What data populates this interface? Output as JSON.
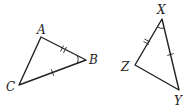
{
  "diagram": {
    "triangles": [
      {
        "name": "ABC",
        "vertices": {
          "A": {
            "label": "A",
            "x": 41,
            "y": 37,
            "lx": 37,
            "ly": 34
          },
          "B": {
            "label": "B",
            "x": 86,
            "y": 60,
            "lx": 89,
            "ly": 64
          },
          "C": {
            "label": "C",
            "x": 19,
            "y": 85,
            "lx": 6,
            "ly": 91
          }
        },
        "marks": {
          "AB": "double-tick",
          "BC": "single-tick",
          "angle_B": "single-arc"
        }
      },
      {
        "name": "XYZ",
        "vertices": {
          "X": {
            "label": "X",
            "x": 162,
            "y": 19,
            "lx": 157,
            "ly": 14
          },
          "Y": {
            "label": "Y",
            "x": 179,
            "y": 90,
            "lx": 174,
            "ly": 105
          },
          "Z": {
            "label": "Z",
            "x": 135,
            "y": 65,
            "lx": 121,
            "ly": 71
          }
        },
        "marks": {
          "XZ": "double-tick",
          "XY": "single-tick",
          "angle_X": "single-arc"
        }
      }
    ],
    "colors": {
      "stroke": "#222222",
      "background": "#ffffff"
    }
  }
}
